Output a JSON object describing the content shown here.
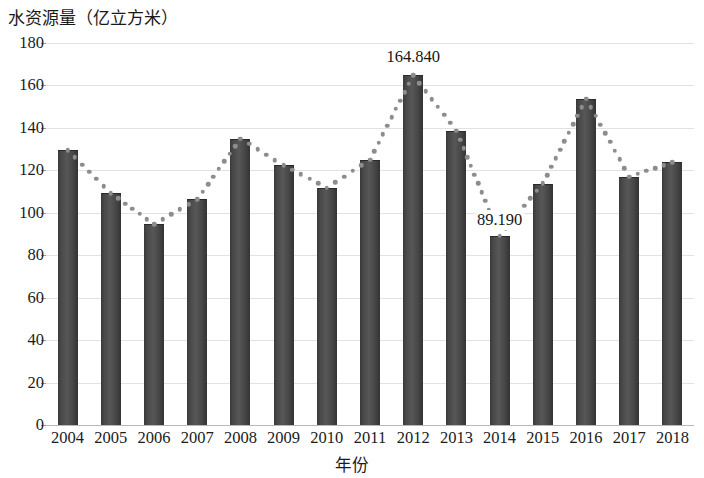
{
  "chart_data": {
    "type": "bar",
    "title": "水资源量（亿立方米）",
    "xlabel": "年份",
    "ylabel": "",
    "ylim": [
      0,
      180
    ],
    "ytick_step": 20,
    "yticks": [
      180,
      160,
      140,
      120,
      100,
      80,
      60,
      40,
      20,
      0
    ],
    "grid": true,
    "legend": "none",
    "categories": [
      "2004",
      "2005",
      "2006",
      "2007",
      "2008",
      "2009",
      "2010",
      "2011",
      "2012",
      "2013",
      "2014",
      "2015",
      "2016",
      "2017",
      "2018"
    ],
    "series": [
      {
        "name": "水资源量",
        "kind": "bar",
        "color": "#4a4a4a",
        "values": [
          129.5,
          109.2,
          94.6,
          106.3,
          135.0,
          122.3,
          111.8,
          125.0,
          164.84,
          138.6,
          89.19,
          113.8,
          153.8,
          117.0,
          123.8
        ]
      },
      {
        "name": "趋势线",
        "kind": "dotted-line",
        "color": "#8d8d8d",
        "values": [
          129.5,
          109.2,
          94.6,
          106.3,
          135.0,
          122.3,
          111.8,
          125.0,
          164.84,
          138.6,
          89.19,
          113.8,
          153.8,
          117.0,
          123.8
        ]
      }
    ],
    "annotations": [
      {
        "category": "2012",
        "value": 164.84,
        "text": "164.840"
      },
      {
        "category": "2014",
        "value": 89.19,
        "text": "89.190"
      }
    ]
  }
}
